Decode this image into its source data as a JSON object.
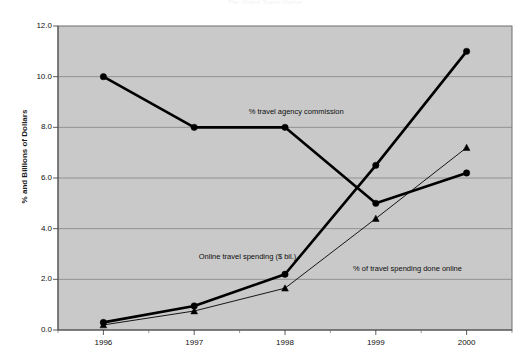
{
  "chart_data": {
    "type": "line",
    "title": "The Online Travel Market",
    "xlabel": "",
    "ylabel": "% and Billions of Dollars",
    "categories": [
      "1996",
      "1997",
      "1998",
      "1999",
      "2000"
    ],
    "x": [
      1996,
      1997,
      1998,
      1999,
      2000
    ],
    "ylim": [
      0.0,
      12.0
    ],
    "ytick_values": [
      "0.0",
      "2.0",
      "4.0",
      "6.0",
      "8.0",
      "10.0",
      "12.0"
    ],
    "grid": true,
    "grid_axis": "y",
    "legend_position": "inline-annotations",
    "plot_background": "#c9c9c9",
    "series": [
      {
        "name": "% travel agency commission",
        "marker": "circle",
        "line_width": "thick",
        "color": "#000000",
        "values": [
          10.0,
          8.0,
          8.0,
          5.0,
          6.2
        ]
      },
      {
        "name": "Online travel spending ($ bil.)",
        "marker": "circle",
        "line_width": "thick",
        "color": "#000000",
        "values": [
          0.3,
          0.95,
          2.2,
          6.5,
          11.0
        ]
      },
      {
        "name": "% of travel spending done online",
        "marker": "triangle",
        "line_width": "thin",
        "color": "#000000",
        "values": [
          0.2,
          0.75,
          1.65,
          4.4,
          7.2
        ]
      }
    ],
    "annotations": [
      {
        "text": "% travel agency commission",
        "x": 1997.6,
        "y": 8.55
      },
      {
        "text": "Online travel spending ($ bil.)",
        "x": 1997.05,
        "y": 2.85
      },
      {
        "text": "% of travel spending done online",
        "x": 1998.75,
        "y": 2.35
      }
    ]
  }
}
